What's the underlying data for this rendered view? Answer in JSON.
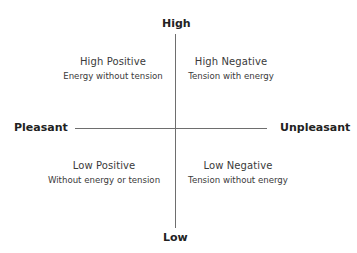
{
  "diagram": {
    "axes": {
      "top": "High",
      "bottom": "Low",
      "left": "Pleasant",
      "right": "Unpleasant"
    },
    "quadrants": [
      {
        "position": "top-left",
        "title": "High Positive",
        "subtitle": "Energy without tension"
      },
      {
        "position": "top-right",
        "title": "High Negative",
        "subtitle": "Tension with energy"
      },
      {
        "position": "bottom-left",
        "title": "Low Positive",
        "subtitle": "Without energy or tension"
      },
      {
        "position": "bottom-right",
        "title": "Low Negative",
        "subtitle": "Tension without energy"
      }
    ],
    "colors": {
      "axis_line": "#6e6e6e",
      "axis_label": "#222222",
      "quadrant_text": "#3a3a3a",
      "background": "#ffffff"
    }
  }
}
